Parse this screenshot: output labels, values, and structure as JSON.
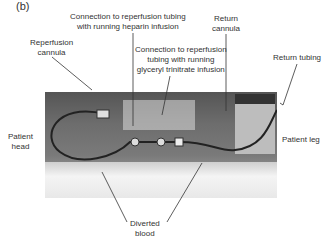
{
  "figure": {
    "panel_label": "(b)",
    "labels": {
      "reperfusion_cannula": [
        "Reperfusion",
        "cannula"
      ],
      "heparin_connection": [
        "Connection to reperfusion tubing",
        "with running heparin infusion"
      ],
      "gtn_connection": [
        "Connection to reperfusion",
        "tubing with running",
        "glyceryl trinitrate infusion"
      ],
      "return_cannula": [
        "Return",
        "cannula"
      ],
      "return_tubing": [
        "Return tubing"
      ],
      "patient_head": [
        "Patient",
        "head"
      ],
      "patient_leg": [
        "Patient leg"
      ],
      "diverted_blood": [
        "Diverted",
        "blood"
      ]
    },
    "colors": {
      "text": "#333333",
      "leader_lines": "#333333",
      "background": "#ffffff"
    }
  }
}
